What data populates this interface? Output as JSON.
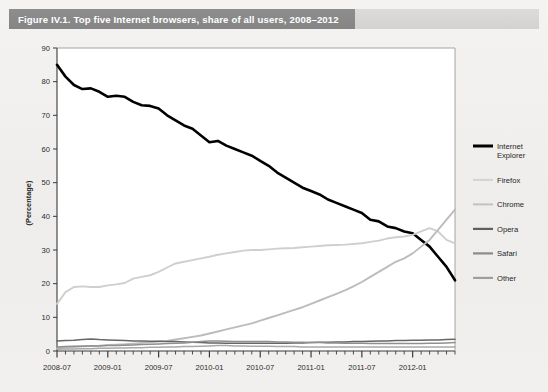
{
  "figure": {
    "title": "Figure IV.1.  Top five Internet browsers, share of all users, 2008–2012"
  },
  "chart_data": {
    "type": "line",
    "title": "Top five Internet browsers, share of all users, 2008–2012",
    "xlabel": "",
    "ylabel": "(Percentage)",
    "ylim": [
      0,
      90
    ],
    "yticks": [
      0,
      10,
      20,
      30,
      40,
      50,
      60,
      70,
      80,
      90
    ],
    "xtick_labels": [
      "2008-07",
      "2009-01",
      "2009-07",
      "2010-01",
      "2010-07",
      "2011-01",
      "2011-07",
      "2012-01"
    ],
    "x_start": "2008-07",
    "x_end": "2012-06",
    "x_step_months": 1,
    "grid": false,
    "legend_position": "right",
    "x": [
      "2008-07",
      "2008-08",
      "2008-09",
      "2008-10",
      "2008-11",
      "2008-12",
      "2009-01",
      "2009-02",
      "2009-03",
      "2009-04",
      "2009-05",
      "2009-06",
      "2009-07",
      "2009-08",
      "2009-09",
      "2009-10",
      "2009-11",
      "2009-12",
      "2010-01",
      "2010-02",
      "2010-03",
      "2010-04",
      "2010-05",
      "2010-06",
      "2010-07",
      "2010-08",
      "2010-09",
      "2010-10",
      "2010-11",
      "2010-12",
      "2011-01",
      "2011-02",
      "2011-03",
      "2011-04",
      "2011-05",
      "2011-06",
      "2011-07",
      "2011-08",
      "2011-09",
      "2011-10",
      "2011-11",
      "2011-12",
      "2012-01",
      "2012-02",
      "2012-03",
      "2012-04",
      "2012-05",
      "2012-06"
    ],
    "series": [
      {
        "name": "Internet Explorer",
        "color": "#000000",
        "width": 2.6,
        "values": [
          85.0,
          81.5,
          79.0,
          77.8,
          78.0,
          77.0,
          75.5,
          75.8,
          75.5,
          74.0,
          73.0,
          72.8,
          72.0,
          70.0,
          68.5,
          67.0,
          66.0,
          64.0,
          62.0,
          62.4,
          61.0,
          60.0,
          59.0,
          58.0,
          56.5,
          55.0,
          53.0,
          51.5,
          50.0,
          48.5,
          47.5,
          46.5,
          45.0,
          44.0,
          43.0,
          42.0,
          41.0,
          39.0,
          38.5,
          37.0,
          36.5,
          35.5,
          35.0,
          33.0,
          31.0,
          28.0,
          25.0,
          21.0
        ]
      },
      {
        "name": "Firefox",
        "color": "#cfcfcf",
        "width": 1.9,
        "values": [
          14.0,
          17.5,
          19.0,
          19.2,
          19.0,
          19.0,
          19.5,
          19.8,
          20.2,
          21.5,
          22.0,
          22.5,
          23.5,
          24.8,
          26.0,
          26.5,
          27.0,
          27.5,
          28.0,
          28.6,
          29.0,
          29.4,
          29.8,
          30.0,
          30.0,
          30.2,
          30.4,
          30.5,
          30.6,
          30.8,
          31.0,
          31.2,
          31.4,
          31.5,
          31.6,
          31.8,
          32.0,
          32.4,
          32.8,
          33.4,
          33.8,
          34.0,
          34.5,
          35.5,
          36.5,
          35.5,
          33.0,
          32.0
        ]
      },
      {
        "name": "Chrome",
        "color": "#bcbcbc",
        "width": 1.9,
        "values": [
          0.8,
          1.0,
          1.2,
          1.4,
          1.5,
          1.6,
          1.8,
          1.9,
          2.0,
          2.2,
          2.4,
          2.6,
          2.8,
          3.0,
          3.4,
          3.8,
          4.2,
          4.6,
          5.2,
          5.8,
          6.4,
          7.0,
          7.6,
          8.2,
          9.0,
          9.8,
          10.6,
          11.4,
          12.2,
          13.0,
          14.0,
          15.0,
          16.0,
          17.0,
          18.0,
          19.2,
          20.5,
          22.0,
          23.5,
          25.0,
          26.5,
          27.5,
          29.0,
          31.0,
          33.0,
          36.0,
          39.0,
          42.0
        ]
      },
      {
        "name": "Opera",
        "color": "#666666",
        "width": 1.5,
        "values": [
          3.0,
          3.1,
          3.2,
          3.4,
          3.6,
          3.4,
          3.3,
          3.2,
          3.1,
          3.0,
          3.0,
          2.9,
          2.9,
          2.8,
          2.8,
          2.7,
          2.6,
          2.5,
          2.4,
          2.4,
          2.3,
          2.3,
          2.3,
          2.3,
          2.3,
          2.3,
          2.3,
          2.3,
          2.4,
          2.4,
          2.5,
          2.6,
          2.6,
          2.7,
          2.7,
          2.8,
          2.8,
          2.9,
          3.0,
          3.0,
          3.1,
          3.1,
          3.2,
          3.2,
          3.3,
          3.3,
          3.4,
          3.5
        ]
      },
      {
        "name": "Safari",
        "color": "#8f8f8f",
        "width": 1.5,
        "values": [
          1.2,
          1.3,
          1.4,
          1.4,
          1.5,
          1.5,
          1.6,
          1.6,
          1.7,
          1.8,
          1.9,
          2.0,
          2.1,
          2.2,
          2.3,
          2.4,
          2.6,
          2.8,
          3.0,
          3.0,
          2.9,
          2.8,
          2.8,
          2.8,
          2.8,
          2.8,
          2.7,
          2.7,
          2.6,
          2.6,
          2.5,
          2.5,
          2.4,
          2.4,
          2.3,
          2.3,
          2.3,
          2.2,
          2.2,
          2.2,
          2.2,
          2.2,
          2.2,
          2.2,
          2.3,
          2.3,
          2.4,
          2.5
        ]
      },
      {
        "name": "Other",
        "color": "#a8a8a8",
        "width": 1.5,
        "values": [
          0.5,
          0.6,
          0.6,
          0.7,
          0.7,
          0.8,
          0.8,
          0.9,
          0.9,
          1.0,
          1.0,
          1.1,
          1.1,
          1.2,
          1.2,
          1.3,
          1.3,
          1.4,
          1.5,
          1.6,
          1.6,
          1.5,
          1.5,
          1.4,
          1.4,
          1.4,
          1.3,
          1.3,
          1.3,
          1.2,
          1.2,
          1.2,
          1.2,
          1.2,
          1.2,
          1.2,
          1.2,
          1.2,
          1.2,
          1.2,
          1.2,
          1.2,
          1.2,
          1.2,
          1.2,
          1.2,
          1.2,
          1.2
        ]
      }
    ]
  },
  "legend": {
    "items": [
      {
        "label_line1": "Internet",
        "label_line2": "Explorer",
        "color": "#000000",
        "width": 3.0
      },
      {
        "label_line1": "Firefox",
        "label_line2": "",
        "color": "#d2d2d2",
        "width": 2.0
      },
      {
        "label_line1": "Chrome",
        "label_line2": "",
        "color": "#c2c2c2",
        "width": 2.0
      },
      {
        "label_line1": "Opera",
        "label_line2": "",
        "color": "#5e5e5e",
        "width": 2.2
      },
      {
        "label_line1": "Safari",
        "label_line2": "",
        "color": "#8a8a8a",
        "width": 2.2
      },
      {
        "label_line1": "Other",
        "label_line2": "",
        "color": "#9e9e9e",
        "width": 2.2
      }
    ]
  },
  "colors": {
    "title_band": "#8a8a8a",
    "page_background": "#f1f0ee",
    "plot_background": "#ffffff",
    "axis": "#3a3a3a"
  }
}
